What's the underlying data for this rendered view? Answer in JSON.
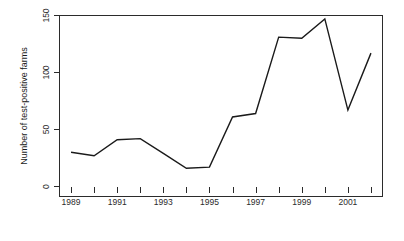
{
  "chart_data": {
    "type": "line",
    "title": "",
    "subtitle": "",
    "xlabel": "",
    "ylabel": "Number of test-positive farms",
    "x": [
      1989,
      1990,
      1991,
      1992,
      1993,
      1994,
      1995,
      1996,
      1997,
      1998,
      1999,
      2000,
      2001,
      2002
    ],
    "values": [
      30,
      27,
      41,
      42,
      29,
      16,
      17,
      61,
      64,
      131,
      130,
      147,
      67,
      117
    ],
    "series": [
      {
        "name": "test-positive farms",
        "values": [
          30,
          27,
          41,
          42,
          29,
          16,
          17,
          61,
          64,
          131,
          130,
          147,
          67,
          117
        ],
        "color": "#1a1a1a"
      }
    ],
    "xlim": [
      1988.5,
      2002.5
    ],
    "ylim": [
      0,
      150
    ],
    "y_ticks": [
      0,
      50,
      100,
      150
    ],
    "y_tick_labels": [
      "0",
      "50",
      "100",
      "150"
    ],
    "x_ticks": [
      1989,
      1990,
      1991,
      1992,
      1993,
      1994,
      1995,
      1996,
      1997,
      1998,
      1999,
      2000,
      2001,
      2002
    ],
    "x_tick_labels": [
      "1989",
      "",
      "1991",
      "",
      "1993",
      "",
      "1995",
      "",
      "1997",
      "",
      "1999",
      "",
      "2001",
      ""
    ],
    "x_labeled_ticks": [
      {
        "value": 1989,
        "label": "1989"
      },
      {
        "value": 1991,
        "label": "1991"
      },
      {
        "value": 1993,
        "label": "1993"
      },
      {
        "value": 1995,
        "label": "1995"
      },
      {
        "value": 1997,
        "label": "1997"
      },
      {
        "value": 1999,
        "label": "1999"
      },
      {
        "value": 2001,
        "label": "2001"
      }
    ],
    "grid": false,
    "legend": false,
    "legend_position": "none",
    "frame": "box",
    "line_color": "#1a1a1a",
    "background_color": "#ffffff"
  },
  "figure": {
    "y_axis_title": "Number of test-positive farms",
    "x_axis_title": ""
  }
}
